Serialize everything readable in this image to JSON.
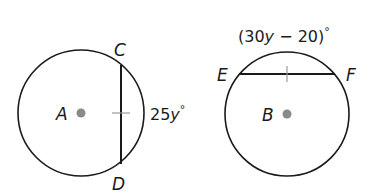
{
  "figures": [
    {
      "circle": {
        "center_label": "A",
        "center": [
          81,
          113
        ],
        "radius": 63
      },
      "chord": {
        "endpoints": [
          "C",
          "D"
        ],
        "x": 121,
        "y1": 66,
        "y2": 163
      },
      "arc_measure": {
        "coef": "25",
        "var": "y",
        "degree": "°"
      }
    },
    {
      "circle": {
        "center_label": "B",
        "center": [
          287,
          114
        ],
        "radius": 62
      },
      "chord": {
        "endpoints": [
          "E",
          "F"
        ],
        "y": 74,
        "x1": 239,
        "x2": 335
      },
      "arc_measure": {
        "open": "(30",
        "var": "y",
        "rest": " − 20)",
        "degree": "°"
      }
    }
  ],
  "colors": {
    "stroke": "#1a1a1a",
    "center_dot": "#8a8a8a",
    "tick": "#9a9a9a"
  }
}
